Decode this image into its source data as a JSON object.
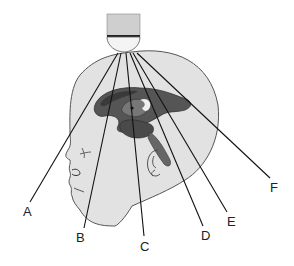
{
  "figure": {
    "labels": [
      {
        "id": "A",
        "text": "A",
        "x": 23,
        "y": 205
      },
      {
        "id": "B",
        "text": "B",
        "x": 76,
        "y": 231
      },
      {
        "id": "C",
        "text": "C",
        "x": 140,
        "y": 240
      },
      {
        "id": "D",
        "text": "D",
        "x": 201,
        "y": 229
      },
      {
        "id": "E",
        "text": "E",
        "x": 227,
        "y": 215
      },
      {
        "id": "F",
        "text": "F",
        "x": 270,
        "y": 181
      }
    ],
    "colors": {
      "head_fill": "#e2e2e2",
      "head_stroke": "#555555",
      "brain_dark": "#3a3a3a",
      "brain_mid": "#6a6a6a",
      "probe_body": "#cfcfcf",
      "lines": "#111111"
    }
  }
}
